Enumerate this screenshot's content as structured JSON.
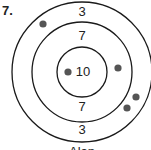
{
  "problem": {
    "number": "7."
  },
  "target": {
    "center": [
      82,
      72
    ],
    "rings": [
      {
        "radius": 70,
        "score": "3"
      },
      {
        "radius": 50,
        "score": "7"
      },
      {
        "radius": 25,
        "score": "10"
      }
    ],
    "labels": [
      {
        "text": "3",
        "x": 82,
        "y": 16
      },
      {
        "text": "7",
        "x": 82,
        "y": 40
      },
      {
        "text": "10",
        "x": 83,
        "y": 76
      },
      {
        "text": "7",
        "x": 82,
        "y": 111
      },
      {
        "text": "3",
        "x": 82,
        "y": 134
      }
    ],
    "darts": [
      {
        "x": 43,
        "y": 24
      },
      {
        "x": 68,
        "y": 72
      },
      {
        "x": 118,
        "y": 68
      },
      {
        "x": 136,
        "y": 97
      },
      {
        "x": 127,
        "y": 108
      }
    ],
    "colors": {
      "line": "#1a1a1a",
      "dart": "#555555"
    }
  },
  "caption": "Alan"
}
